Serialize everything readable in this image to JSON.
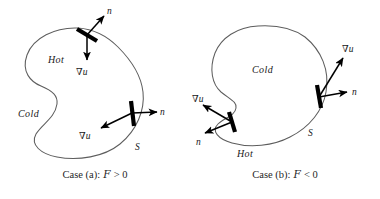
{
  "figure": {
    "background_color": "#ffffff",
    "outline_color": "#5d5d5d",
    "vector_color": "#000000",
    "text_color": "#202020"
  },
  "panels": [
    {
      "id": "case-a",
      "region_labels": {
        "inner": "Hot",
        "outer": "Cold"
      },
      "surface_label": "S",
      "vectors": [
        {
          "id": "normal-top",
          "label": "n",
          "label_symbol": "n"
        },
        {
          "id": "gradient-top",
          "label": "∇u",
          "nabla": "∇",
          "variable": "u"
        },
        {
          "id": "normal-right",
          "label": "n",
          "label_symbol": "n"
        },
        {
          "id": "gradient-right",
          "label": "∇u",
          "nabla": "∇",
          "variable": "u"
        }
      ],
      "caption": {
        "prefix": "Case (a):",
        "symbol": "F",
        "relation": "> 0",
        "full": "Case (a): F > 0"
      }
    },
    {
      "id": "case-b",
      "region_labels": {
        "inner": "Cold",
        "outer": "Hot"
      },
      "surface_label": "S",
      "vectors": [
        {
          "id": "gradient-left",
          "label": "∇u",
          "nabla": "∇",
          "variable": "u"
        },
        {
          "id": "normal-left",
          "label": "n",
          "label_symbol": "n"
        },
        {
          "id": "gradient-right",
          "label": "∇u",
          "nabla": "∇",
          "variable": "u"
        },
        {
          "id": "normal-right",
          "label": "n",
          "label_symbol": "n"
        }
      ],
      "caption": {
        "prefix": "Case (b):",
        "symbol": "F",
        "relation": "< 0",
        "full": "Case (b): F < 0"
      }
    }
  ]
}
